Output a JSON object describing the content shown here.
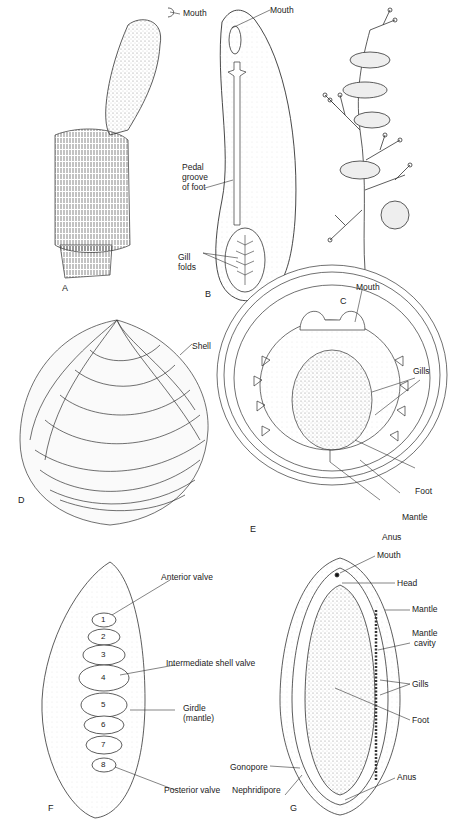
{
  "figure": {
    "panels": [
      {
        "id": "A",
        "letter": "A",
        "labels": [
          "Mouth"
        ]
      },
      {
        "id": "B",
        "letter": "B",
        "labels": [
          "Mouth",
          "Pedal groove of foot",
          "Gill folds"
        ]
      },
      {
        "id": "C",
        "letter": "C",
        "labels": []
      },
      {
        "id": "D",
        "letter": "D",
        "labels": [
          "Shell"
        ]
      },
      {
        "id": "E",
        "letter": "E",
        "labels": [
          "Mouth",
          "Gills",
          "Foot",
          "Mantle",
          "Anus"
        ]
      },
      {
        "id": "F",
        "letter": "F",
        "labels": [
          "Anterior valve",
          "Intermediate shell valve",
          "Girdle (mantle)",
          "Posterior valve"
        ],
        "valve_numbers": [
          "1",
          "2",
          "3",
          "4",
          "5",
          "6",
          "7",
          "8"
        ]
      },
      {
        "id": "G",
        "letter": "G",
        "labels": [
          "Mouth",
          "Head",
          "Mantle",
          "Mantle cavity",
          "Gills",
          "Foot",
          "Gonopore",
          "Nephridipore",
          "Anus"
        ]
      }
    ]
  },
  "A": {
    "letter": "A",
    "mouth": "Mouth"
  },
  "B": {
    "letter": "B",
    "mouth": "Mouth",
    "pedal1": "Pedal",
    "pedal2": "groove",
    "pedal3": "of foot",
    "gill1": "Gill",
    "gill2": "folds"
  },
  "C": {
    "letter": "C"
  },
  "D": {
    "letter": "D",
    "shell": "Shell"
  },
  "E": {
    "letter": "E",
    "mouth": "Mouth",
    "gills": "Gills",
    "foot": "Foot",
    "mantle": "Mantle",
    "anus": "Anus"
  },
  "F": {
    "letter": "F",
    "anterior": "Anterior valve",
    "intermediate": "Intermediate shell valve",
    "girdle1": "Girdle",
    "girdle2": "(mantle)",
    "posterior": "Posterior valve",
    "valves": [
      "1",
      "2",
      "3",
      "4",
      "5",
      "6",
      "7",
      "8"
    ]
  },
  "G": {
    "letter": "G",
    "mouth": "Mouth",
    "head": "Head",
    "mantle": "Mantle",
    "cavity1": "Mantle",
    "cavity2": "cavity",
    "gills": "Gills",
    "foot": "Foot",
    "gonopore": "Gonopore",
    "nephridipore": "Nephridipore",
    "anus": "Anus"
  }
}
